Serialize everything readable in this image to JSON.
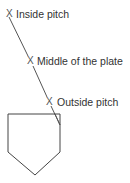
{
  "diagram": {
    "markers": [
      {
        "id": "inside",
        "symbol": "X",
        "label": "Inside pitch"
      },
      {
        "id": "middle",
        "symbol": "X",
        "label": "Middle of the plate"
      },
      {
        "id": "outside",
        "symbol": "X",
        "label": "Outside pitch"
      }
    ],
    "shapes": {
      "home_plate": "pentagon",
      "pitch_path": "diagonal-line"
    },
    "colors": {
      "line": "#444444",
      "text": "#333333",
      "background": "#ffffff"
    }
  }
}
